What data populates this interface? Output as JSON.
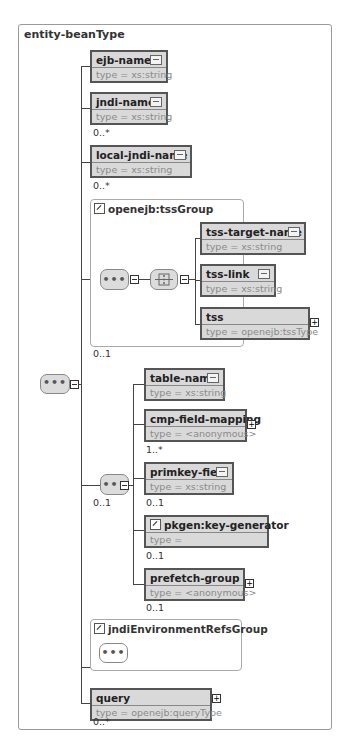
{
  "diagram": {
    "title": "entity-beanType",
    "elements": [
      {
        "name": "ejb-name",
        "type": "type = xs:string",
        "cardinality": ""
      },
      {
        "name": "jndi-name",
        "type": "type = xs:string",
        "cardinality": "0..*"
      },
      {
        "name": "local-jndi-name",
        "type": "type = xs:string",
        "cardinality": "0..*"
      }
    ],
    "tssGroup": {
      "title": "openejb:tssGroup",
      "cardinality": "0..1",
      "elements": [
        {
          "name": "tss-target-name",
          "type": "type = xs:string"
        },
        {
          "name": "tss-link",
          "type": "type = xs:string"
        },
        {
          "name": "tss",
          "type": "type = openejb:tssType"
        }
      ]
    },
    "innerSequence": {
      "cardinality": "0..1",
      "elements": [
        {
          "name": "table-name",
          "type": "type = xs:string",
          "cardinality": ""
        },
        {
          "name": "cmp-field-mapping",
          "type": "type = <anonymous>",
          "cardinality": "1..*"
        },
        {
          "name": "primkey-field",
          "type": "type = xs:string",
          "cardinality": "0..1"
        },
        {
          "name": "pkgen:key-generator",
          "type": "type =",
          "cardinality": "0..1"
        },
        {
          "name": "prefetch-group",
          "type": "type = <anonymous>",
          "cardinality": "0..1"
        }
      ]
    },
    "jndiGroup": {
      "title": "jndiEnvironmentRefsGroup"
    },
    "query": {
      "name": "query",
      "type": "type = openejb:queryType",
      "cardinality": "0..*"
    },
    "sequence_glyph": "•••",
    "expand_glyph": "+"
  }
}
